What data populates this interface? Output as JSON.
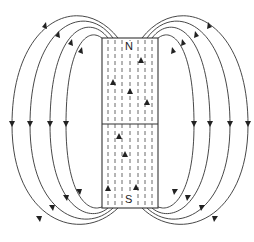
{
  "diagram": {
    "magnet": {
      "north_label": "N",
      "south_label": "S",
      "internal_field_direction": "south-to-north (upward)"
    },
    "field_lines": {
      "count_per_side": 4,
      "external_direction": "from N pole around to S pole"
    },
    "colors": {
      "line": "#333333",
      "background": "#ffffff"
    }
  }
}
